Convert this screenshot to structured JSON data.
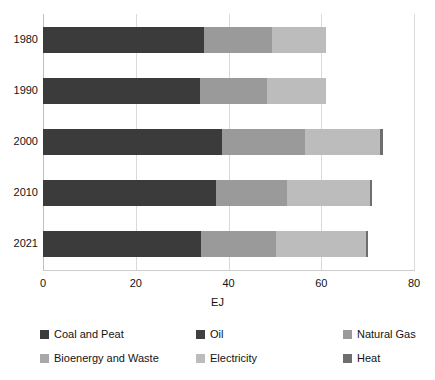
{
  "chart_data": {
    "type": "bar",
    "orientation": "horizontal",
    "stacked": true,
    "title": "",
    "xlabel": "EJ",
    "ylabel": "",
    "xlim": [
      0,
      80
    ],
    "xticks": [
      0,
      20,
      40,
      60,
      80
    ],
    "xticklabels": [
      "0",
      "20",
      "40",
      "60",
      "80"
    ],
    "categories": [
      "1980",
      "1990",
      "2000",
      "2010",
      "2021"
    ],
    "grid": "vertical",
    "legend_position": "bottom",
    "series": [
      {
        "name": "Coal and Peat",
        "color": "#3b3b3b",
        "values": [
          34.8,
          33.8,
          38.7,
          37.2,
          34.1
        ]
      },
      {
        "name": "Oil",
        "color": "#404040",
        "values": [
          0,
          0,
          0,
          0,
          0
        ]
      },
      {
        "name": "Natural Gas",
        "color": "#9a9a9a",
        "values": [
          14.6,
          14.4,
          17.8,
          15.5,
          16.2
        ]
      },
      {
        "name": "Bioenergy and Waste",
        "color": "#a8a8a8",
        "values": [
          0,
          0,
          0,
          0,
          0
        ]
      },
      {
        "name": "Electricity",
        "color": "#bcbcbc",
        "values": [
          11.6,
          12.8,
          16.2,
          17.8,
          19.3
        ]
      },
      {
        "name": "Heat",
        "color": "#6e6e6e",
        "values": [
          0,
          0,
          0.6,
          0.4,
          0.4
        ]
      }
    ],
    "totals": [
      61.0,
      61.0,
      73.3,
      70.9,
      70.0
    ]
  },
  "legend": {
    "items": [
      {
        "label": "Coal and Peat",
        "color": "#3b3b3b"
      },
      {
        "label": "Oil",
        "color": "#404040"
      },
      {
        "label": "Natural Gas",
        "color": "#9a9a9a"
      },
      {
        "label": "Bioenergy and Waste",
        "color": "#a8a8a8"
      },
      {
        "label": "Electricity",
        "color": "#bcbcbc"
      },
      {
        "label": "Heat",
        "color": "#6e6e6e"
      }
    ]
  },
  "axis": {
    "x_title": "EJ",
    "x_ticklabels": [
      "0",
      "20",
      "40",
      "60",
      "80"
    ],
    "y_ticklabels": [
      "1980",
      "1990",
      "2000",
      "2010",
      "2021"
    ]
  }
}
